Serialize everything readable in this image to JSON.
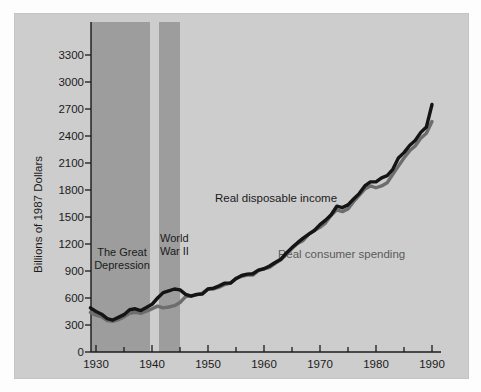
{
  "figure": {
    "background_color": "#fdfdfd",
    "panel_color": "#cdcdcd",
    "band_color": "#9d9d9d",
    "axis_color": "#1b1b1b"
  },
  "chart_data": {
    "type": "line",
    "title": "",
    "xlabel": "",
    "ylabel": "Billions of 1987 Dollars",
    "xlim": [
      1928,
      1991
    ],
    "ylim": [
      0,
      3450
    ],
    "ytick_values": [
      0,
      300,
      600,
      900,
      1200,
      1500,
      1800,
      2100,
      2400,
      2700,
      3000,
      3300
    ],
    "ytick_labels": [
      "0",
      "300",
      "600",
      "900",
      "1200",
      "1500",
      "1800",
      "2100",
      "2400",
      "2700",
      "3000",
      "3300"
    ],
    "xtick_major_values": [
      1930,
      1940,
      1950,
      1960,
      1970,
      1980,
      1990
    ],
    "xtick_major_labels": [
      "1930",
      "1940",
      "1950",
      "1960",
      "1970",
      "1980",
      "1990"
    ],
    "xtick_minor_values": [
      1935,
      1945,
      1955,
      1965,
      1975,
      1985
    ],
    "grid": false,
    "legend_position": "inline-annotation",
    "x": [
      1929,
      1930,
      1931,
      1932,
      1933,
      1934,
      1935,
      1936,
      1937,
      1938,
      1939,
      1940,
      1941,
      1942,
      1943,
      1944,
      1945,
      1946,
      1947,
      1948,
      1949,
      1950,
      1951,
      1952,
      1953,
      1954,
      1955,
      1956,
      1957,
      1958,
      1959,
      1960,
      1961,
      1962,
      1963,
      1964,
      1965,
      1966,
      1967,
      1968,
      1969,
      1970,
      1971,
      1972,
      1973,
      1974,
      1975,
      1976,
      1977,
      1978,
      1979,
      1980,
      1981,
      1982,
      1983,
      1984,
      1985,
      1986,
      1987,
      1988,
      1989,
      1990
    ],
    "series": [
      {
        "name": "Real disposable income",
        "color": "#141414",
        "line_width": 3.4,
        "label_color": "#1b1b1b",
        "values": [
          490,
          450,
          420,
          370,
          355,
          385,
          415,
          470,
          480,
          460,
          495,
          530,
          600,
          660,
          680,
          700,
          690,
          640,
          620,
          640,
          645,
          700,
          710,
          735,
          765,
          765,
          815,
          850,
          865,
          870,
          910,
          925,
          955,
          995,
          1030,
          1100,
          1160,
          1215,
          1265,
          1310,
          1350,
          1415,
          1465,
          1525,
          1620,
          1605,
          1635,
          1700,
          1760,
          1845,
          1890,
          1890,
          1935,
          1960,
          2030,
          2155,
          2215,
          2295,
          2350,
          2440,
          2500,
          2750
        ]
      },
      {
        "name": "Real consumer spending",
        "color": "#6d6d6d",
        "line_width": 3.4,
        "label_color": "#5a5a5a",
        "values": [
          440,
          410,
          390,
          350,
          340,
          360,
          390,
          430,
          440,
          430,
          455,
          480,
          510,
          490,
          500,
          515,
          550,
          615,
          625,
          635,
          655,
          700,
          700,
          720,
          750,
          765,
          820,
          840,
          855,
          855,
          905,
          925,
          940,
          985,
          1025,
          1085,
          1150,
          1205,
          1240,
          1310,
          1350,
          1385,
          1435,
          1520,
          1580,
          1560,
          1590,
          1670,
          1740,
          1810,
          1845,
          1825,
          1845,
          1880,
          1975,
          2065,
          2155,
          2235,
          2290,
          2375,
          2430,
          2560
        ]
      }
    ],
    "shaded_regions": [
      {
        "name": "The Great Depression",
        "label": "The Great\nDepression",
        "x_start": 1929,
        "x_end": 1939.6,
        "color": "#9d9d9d"
      },
      {
        "name": "World War II",
        "label": "World\nWar II",
        "x_start": 1941,
        "x_end": 1944.8,
        "color": "#9d9d9d"
      }
    ],
    "annotations": [
      {
        "name": "income-label",
        "text": "Real disposable income",
        "x_px": 215,
        "y_px": 185,
        "color": "#1b1b1b"
      },
      {
        "name": "spending-label",
        "text": "Real consumer spending",
        "x_px": 278,
        "y_px": 241,
        "color": "#5a5a5a"
      }
    ]
  }
}
